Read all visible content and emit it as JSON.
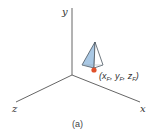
{
  "figure": {
    "caption": "(a)",
    "axes": {
      "y_label": "y",
      "x_label": "x",
      "z_label": "z",
      "color": "#666666"
    },
    "point": {
      "open": "(",
      "x": "x",
      "y": "y",
      "z": "z",
      "subscript": "F",
      "sep": ", ",
      "close": ")",
      "color": "#e0502a"
    },
    "pyramid": {
      "face_color": "#a9c8e4",
      "edge_color": "#4a5560"
    }
  }
}
